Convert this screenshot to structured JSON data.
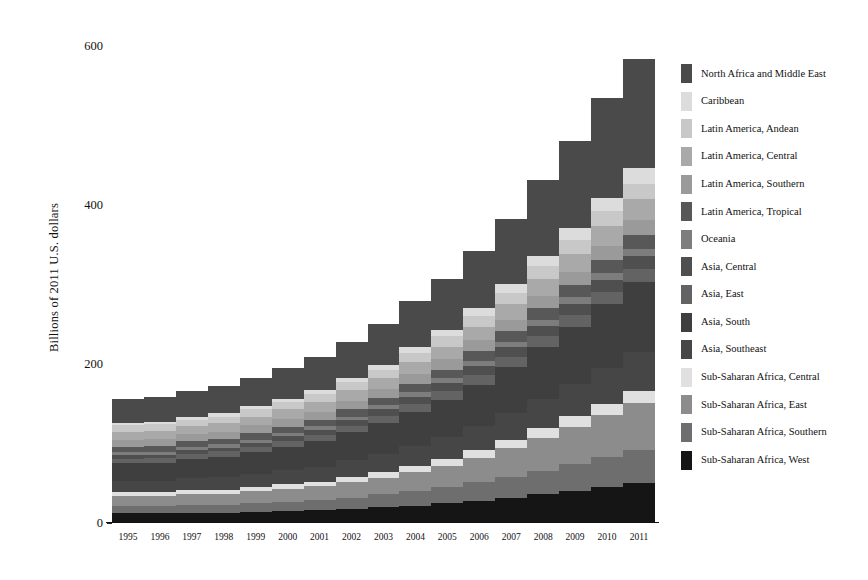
{
  "chart_data": {
    "type": "bar",
    "subtype": "stacked-bar",
    "title": "",
    "xlabel": "",
    "ylabel": "Billions of 2011 U.S. dollars",
    "categories": [
      "1995",
      "1996",
      "1997",
      "1998",
      "1999",
      "2000",
      "2001",
      "2002",
      "2003",
      "2004",
      "2005",
      "2006",
      "2007",
      "2008",
      "2009",
      "2010",
      "2011"
    ],
    "ylim": [
      0,
      620
    ],
    "yticks": [
      0,
      200,
      400,
      600
    ],
    "ytick_labels": [
      "0",
      "200",
      "400",
      "600"
    ],
    "grid": false,
    "legend_position": "right",
    "stack_order": "bottom-to-top reversed from legend (legend top = top of stack)",
    "series": [
      {
        "name": "North Africa and Middle East",
        "color": "#4a4a4a",
        "values": [
          30,
          32,
          33,
          34,
          36,
          39,
          42,
          46,
          52,
          58,
          64,
          72,
          82,
          95,
          110,
          125,
          138
        ]
      },
      {
        "name": "Caribbean",
        "color": "#dcdcdc",
        "values": [
          3,
          3,
          3,
          4,
          4,
          4,
          5,
          5,
          6,
          7,
          8,
          9,
          11,
          13,
          15,
          17,
          19
        ]
      },
      {
        "name": "Latin America, Andean",
        "color": "#c8c8c8",
        "values": [
          8,
          8,
          8,
          8,
          9,
          9,
          10,
          10,
          11,
          12,
          13,
          14,
          15,
          16,
          17,
          18,
          19
        ]
      },
      {
        "name": "Latin America, Central",
        "color": "#a9a9a9",
        "values": [
          10,
          10,
          10,
          11,
          11,
          12,
          12,
          13,
          14,
          15,
          16,
          17,
          19,
          21,
          23,
          25,
          27
        ]
      },
      {
        "name": "Latin America, Southern",
        "color": "#9a9a9a",
        "values": [
          9,
          9,
          9,
          9,
          10,
          10,
          10,
          11,
          11,
          12,
          13,
          14,
          15,
          16,
          17,
          18,
          19
        ]
      },
      {
        "name": "Latin America, Tropical",
        "color": "#585858",
        "values": [
          7,
          7,
          7,
          7,
          8,
          8,
          8,
          9,
          9,
          10,
          11,
          12,
          13,
          14,
          15,
          16,
          17
        ]
      },
      {
        "name": "Oceania",
        "color": "#7d7d7d",
        "values": [
          4,
          4,
          4,
          4,
          4,
          4,
          5,
          5,
          5,
          6,
          6,
          7,
          7,
          8,
          8,
          9,
          9
        ]
      },
      {
        "name": "Asia, Central",
        "color": "#4f4f4f",
        "values": [
          4,
          4,
          5,
          5,
          5,
          6,
          6,
          7,
          8,
          9,
          10,
          11,
          12,
          13,
          14,
          15,
          16
        ]
      },
      {
        "name": "Asia, East",
        "color": "#636363",
        "values": [
          6,
          6,
          6,
          7,
          7,
          7,
          8,
          8,
          9,
          10,
          11,
          12,
          13,
          14,
          15,
          16,
          17
        ]
      },
      {
        "name": "Asia, South",
        "color": "#3f3f3f",
        "values": [
          22,
          23,
          24,
          25,
          27,
          29,
          32,
          35,
          39,
          43,
          47,
          52,
          58,
          65,
          72,
          80,
          88
        ]
      },
      {
        "name": "Asia, Southeast",
        "color": "#464646",
        "values": [
          14,
          14,
          15,
          16,
          17,
          18,
          19,
          21,
          23,
          25,
          27,
          30,
          33,
          37,
          41,
          45,
          49
        ]
      },
      {
        "name": "Sub-Saharan Africa, Central",
        "color": "#e0e0e0",
        "values": [
          5,
          5,
          5,
          5,
          5,
          6,
          6,
          7,
          7,
          8,
          9,
          10,
          11,
          12,
          13,
          14,
          15
        ]
      },
      {
        "name": "Sub-Saharan Africa, East",
        "color": "#8c8c8c",
        "values": [
          13,
          13,
          14,
          14,
          15,
          16,
          17,
          19,
          21,
          24,
          27,
          31,
          36,
          41,
          47,
          53,
          59
        ]
      },
      {
        "name": "Sub-Saharan Africa, Southern",
        "color": "#6e6e6e",
        "values": [
          9,
          9,
          10,
          10,
          11,
          12,
          13,
          14,
          16,
          18,
          20,
          23,
          26,
          30,
          34,
          38,
          42
        ]
      },
      {
        "name": "Sub-Saharan Africa, West",
        "color": "#151515",
        "values": [
          12,
          12,
          13,
          13,
          14,
          15,
          16,
          18,
          20,
          22,
          25,
          28,
          32,
          36,
          40,
          45,
          50
        ]
      }
    ],
    "totals": [
      156,
      159,
      166,
      172,
      183,
      195,
      209,
      228,
      251,
      279,
      307,
      342,
      383,
      431,
      481,
      534,
      584
    ]
  },
  "axes": {
    "ylabel": "Billions of 2011 U.S. dollars",
    "ytick_labels": [
      "600",
      "400",
      "200",
      "0"
    ],
    "xtick_labels": [
      "1995",
      "1996",
      "1997",
      "1998",
      "1999",
      "2000",
      "2001",
      "2002",
      "2003",
      "2004",
      "2005",
      "2006",
      "2007",
      "2008",
      "2009",
      "2010",
      "2011"
    ]
  },
  "legend": {
    "items": [
      {
        "label": "North Africa and Middle East",
        "color": "#4a4a4a"
      },
      {
        "label": "Caribbean",
        "color": "#dcdcdc"
      },
      {
        "label": "Latin America, Andean",
        "color": "#c8c8c8"
      },
      {
        "label": "Latin America, Central",
        "color": "#a9a9a9"
      },
      {
        "label": "Latin America, Southern",
        "color": "#9a9a9a"
      },
      {
        "label": "Latin America, Tropical",
        "color": "#585858"
      },
      {
        "label": "Oceania",
        "color": "#7d7d7d"
      },
      {
        "label": "Asia, Central",
        "color": "#4f4f4f"
      },
      {
        "label": "Asia, East",
        "color": "#636363"
      },
      {
        "label": "Asia, South",
        "color": "#3f3f3f"
      },
      {
        "label": "Asia, Southeast",
        "color": "#464646"
      },
      {
        "label": "Sub-Saharan Africa, Central",
        "color": "#e0e0e0"
      },
      {
        "label": "Sub-Saharan Africa, East",
        "color": "#8c8c8c"
      },
      {
        "label": "Sub-Saharan Africa, Southern",
        "color": "#6e6e6e"
      },
      {
        "label": "Sub-Saharan Africa, West",
        "color": "#151515"
      }
    ]
  }
}
